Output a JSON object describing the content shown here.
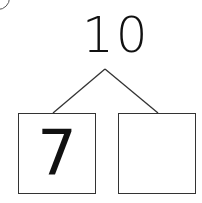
{
  "number_bond": {
    "whole": "10",
    "parts": [
      {
        "value": "7"
      },
      {
        "value": ""
      }
    ]
  }
}
